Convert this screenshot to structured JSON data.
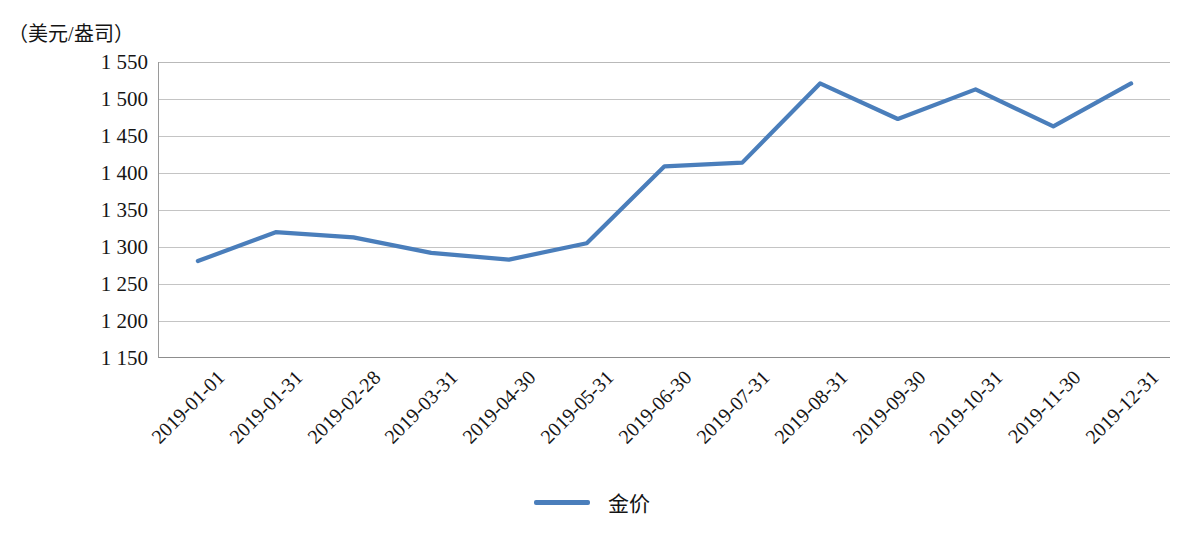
{
  "chart_data": {
    "type": "line",
    "title": "",
    "subtitle": "",
    "ylabel": "（美元/盎司）",
    "xlabel": "",
    "ylim": [
      1150,
      1550
    ],
    "ytick_step": 50,
    "grid": true,
    "legend_position": "bottom-center",
    "categories": [
      "2019-01-01",
      "2019-01-31",
      "2019-02-28",
      "2019-03-31",
      "2019-04-30",
      "2019-05-31",
      "2019-06-30",
      "2019-07-31",
      "2019-08-31",
      "2019-09-30",
      "2019-10-31",
      "2019-11-30",
      "2019-12-31"
    ],
    "ytick_labels": [
      "1 550",
      "1 500",
      "1 450",
      "1 400",
      "1 350",
      "1 300",
      "1 250",
      "1 200",
      "1 150"
    ],
    "ytick_values": [
      1550,
      1500,
      1450,
      1400,
      1350,
      1300,
      1250,
      1200,
      1150
    ],
    "series": [
      {
        "name": "金价",
        "color": "#4a7ebb",
        "values": [
          1281,
          1320,
          1313,
          1292,
          1283,
          1305,
          1409,
          1414,
          1521,
          1473,
          1513,
          1463,
          1521
        ]
      }
    ]
  },
  "legend": {
    "items": [
      {
        "label": "金价",
        "color": "#4a7ebb"
      }
    ]
  },
  "axis": {
    "y_unit_caption": "（美元/盎司）"
  }
}
